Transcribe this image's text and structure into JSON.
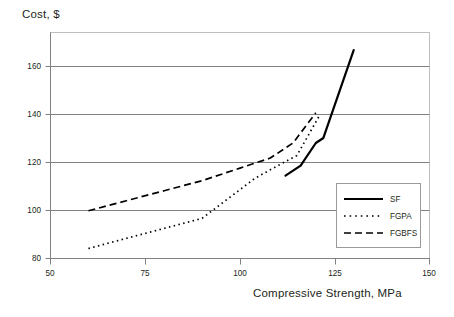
{
  "chart_data": {
    "type": "line",
    "title": "",
    "xlabel": "Compressive Strength, MPa",
    "ylabel": "Cost, $",
    "xlim": [
      50,
      150
    ],
    "ylim": [
      80,
      170
    ],
    "xticks": [
      50,
      75,
      100,
      125,
      150
    ],
    "yticks": [
      80,
      100,
      120,
      140,
      160
    ],
    "grid": true,
    "legend_position": "bottom-right",
    "series": [
      {
        "name": "SF",
        "style": "solid",
        "color": "#000000",
        "points": [
          [
            112,
            113
          ],
          [
            116,
            117
          ],
          [
            120,
            126
          ],
          [
            122,
            128
          ],
          [
            130,
            163
          ]
        ]
      },
      {
        "name": "FGPA",
        "style": "dotted",
        "color": "#000000",
        "points": [
          [
            60,
            84
          ],
          [
            70,
            88
          ],
          [
            80,
            92
          ],
          [
            90,
            96
          ],
          [
            97,
            104
          ],
          [
            104,
            112
          ],
          [
            110,
            117
          ],
          [
            115,
            121
          ],
          [
            121,
            137
          ]
        ]
      },
      {
        "name": "FGBFS",
        "style": "dashed",
        "color": "#000000",
        "points": [
          [
            60,
            99
          ],
          [
            70,
            103
          ],
          [
            80,
            107
          ],
          [
            90,
            111
          ],
          [
            100,
            116
          ],
          [
            108,
            120
          ],
          [
            114,
            126
          ],
          [
            120,
            138
          ]
        ]
      }
    ]
  },
  "axes": {
    "y_title": "Cost, $",
    "x_title": "Compressive Strength, MPa",
    "y_ticks": [
      "160",
      "140",
      "120",
      "100",
      "80"
    ],
    "x_ticks": [
      "50",
      "75",
      "100",
      "125",
      "150"
    ]
  },
  "legend": {
    "items": [
      {
        "label": "SF",
        "style": "solid"
      },
      {
        "label": "FGPA",
        "style": "dotted"
      },
      {
        "label": "FGBFS",
        "style": "dashed"
      }
    ]
  },
  "colors": {
    "line": "#000000",
    "grid": "#7f7f7f",
    "frame": "#b0b0b0",
    "text": "#231f20",
    "background": "#ffffff"
  }
}
